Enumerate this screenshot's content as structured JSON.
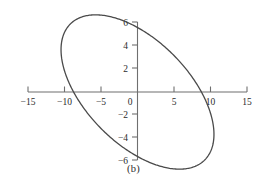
{
  "figure": {
    "panel_label": "(b)",
    "background_color": "#ffffff",
    "axis_color": "#6f6f6f",
    "curve_color": "#4a4a4a",
    "text_color": "#2b2b2b"
  },
  "chart_data": {
    "type": "line",
    "title": "",
    "subtitle": "",
    "xlabel": "",
    "ylabel": "",
    "annotations": [
      "(b)"
    ],
    "grid": false,
    "legend": false,
    "legend_position": "none",
    "xlim": [
      -16,
      16
    ],
    "ylim": [
      -6.8,
      6.8
    ],
    "xticks": [
      -15,
      -10,
      -5,
      0,
      5,
      10,
      15
    ],
    "yticks": [
      -6,
      -4,
      -2,
      0,
      2,
      4,
      6
    ],
    "xtick_labels": [
      "−15",
      "−10",
      "−5",
      "0",
      "5",
      "10",
      "15"
    ],
    "ytick_labels": [
      "−6",
      "−4",
      "−2",
      "0",
      "2",
      "4",
      "6"
    ],
    "axis_position": "zero-crossing",
    "series": [
      {
        "name": "ellipse",
        "closed": true,
        "shape": "rotated-ellipse",
        "center": [
          0,
          0
        ],
        "semi_major": 11.3,
        "semi_minor": 5.2,
        "rotation_deg": -25,
        "x_intercepts": [
          -10,
          10
        ],
        "y_intercepts": [
          -5.1,
          5.1
        ],
        "x_extremes": [
          -11.0,
          11.0
        ],
        "y_extremes": [
          -6.0,
          6.0
        ],
        "top_point": [
          -2.6,
          5.2
        ],
        "bottom_point": [
          2.6,
          -5.2
        ],
        "leftmost_point": [
          -10.5,
          2.0
        ],
        "rightmost_point": [
          10.5,
          -2.0
        ]
      }
    ]
  }
}
